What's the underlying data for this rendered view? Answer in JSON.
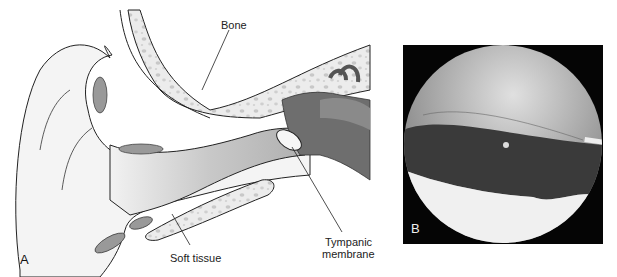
{
  "figure": {
    "panel_a": {
      "letter": "A",
      "labels": {
        "bone": "Bone",
        "soft_tissue": "Soft tissue",
        "tympanic_line1": "Tympanic",
        "tympanic_line2": "membrane"
      }
    },
    "panel_b": {
      "letter": "B"
    }
  }
}
